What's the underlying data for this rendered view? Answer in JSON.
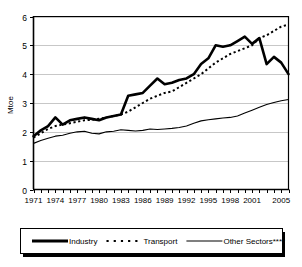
{
  "chart_data": {
    "type": "line",
    "title": "",
    "xlabel": "",
    "ylabel": "Mtoe",
    "ylim": [
      0,
      6
    ],
    "yticks": [
      0,
      1,
      2,
      3,
      4,
      5,
      6
    ],
    "ytick_labels": [
      "0",
      "1",
      "2",
      "3",
      "4",
      "5",
      "6"
    ],
    "xlim": [
      1971,
      2006
    ],
    "x": [
      1971,
      1972,
      1973,
      1974,
      1975,
      1976,
      1977,
      1978,
      1979,
      1980,
      1981,
      1982,
      1983,
      1984,
      1985,
      1986,
      1987,
      1988,
      1989,
      1990,
      1991,
      1992,
      1993,
      1994,
      1995,
      1996,
      1997,
      1998,
      1999,
      2000,
      2001,
      2002,
      2003,
      2004,
      2005,
      2006
    ],
    "xtick_labels": [
      "1971",
      "1974",
      "1977",
      "1980",
      "1983",
      "1986",
      "1989",
      "1992",
      "1995",
      "1998",
      "2001",
      "2005"
    ],
    "xtick_values": [
      1971,
      1974,
      1977,
      1980,
      1983,
      1986,
      1989,
      1992,
      1995,
      1998,
      2001,
      2005
    ],
    "grid": "horizontal",
    "legend_position": "below",
    "series": [
      {
        "name": "Industry",
        "style": "solid-thick",
        "values": [
          1.85,
          2.05,
          2.2,
          2.5,
          2.25,
          2.4,
          2.45,
          2.5,
          2.45,
          2.4,
          2.5,
          2.55,
          2.6,
          3.25,
          3.3,
          3.35,
          3.6,
          3.85,
          3.65,
          3.7,
          3.8,
          3.85,
          4.0,
          4.35,
          4.55,
          5.0,
          4.95,
          5.0,
          5.15,
          5.3,
          5.05,
          5.25,
          4.35,
          4.6,
          4.4,
          4.0
        ]
      },
      {
        "name": "Transport",
        "style": "dotted",
        "values": [
          1.8,
          1.95,
          2.1,
          2.2,
          2.25,
          2.3,
          2.35,
          2.4,
          2.42,
          2.45,
          2.5,
          2.55,
          2.6,
          2.7,
          2.85,
          3.0,
          3.15,
          3.25,
          3.35,
          3.4,
          3.55,
          3.7,
          3.85,
          4.0,
          4.2,
          4.4,
          4.55,
          4.7,
          4.8,
          4.9,
          5.0,
          5.25,
          5.35,
          5.5,
          5.65,
          5.72
        ]
      },
      {
        "name": "Other Sectors****",
        "style": "solid-thin",
        "values": [
          1.6,
          1.7,
          1.78,
          1.85,
          1.88,
          1.95,
          2.0,
          2.02,
          1.95,
          1.93,
          2.0,
          2.02,
          2.07,
          2.05,
          2.03,
          2.05,
          2.1,
          2.08,
          2.1,
          2.12,
          2.15,
          2.2,
          2.3,
          2.38,
          2.42,
          2.45,
          2.48,
          2.5,
          2.55,
          2.65,
          2.75,
          2.85,
          2.95,
          3.02,
          3.08,
          3.12
        ]
      }
    ]
  },
  "legend": {
    "items": [
      {
        "label": "Industry",
        "style": "solid-thick"
      },
      {
        "label": "Transport",
        "style": "dotted"
      },
      {
        "label": "Other Sectors****",
        "style": "solid-thin"
      }
    ]
  },
  "colors": {
    "line": "#000000",
    "grid": "#b9b9b9",
    "axis": "#000000",
    "background": "#ffffff"
  }
}
